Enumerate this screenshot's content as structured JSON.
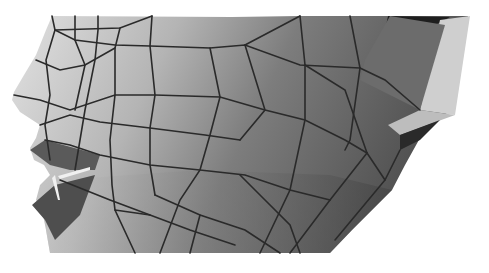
{
  "image": {
    "description": "Grayscale 3D polygon wireframe render of a human face in left profile (nose, lips, cheek, ear region)",
    "width": 489,
    "height": 273
  },
  "colors": {
    "background": "#ffffff",
    "skin_light": "#d8d8d8",
    "skin_mid": "#9a9a9a",
    "skin_dark": "#5a5a5a",
    "edge": "#2a2a2a",
    "lip_dark": "#4a4a4a",
    "ear_light": "#cfcfcf",
    "ear_dark": "#1e1e1e"
  }
}
